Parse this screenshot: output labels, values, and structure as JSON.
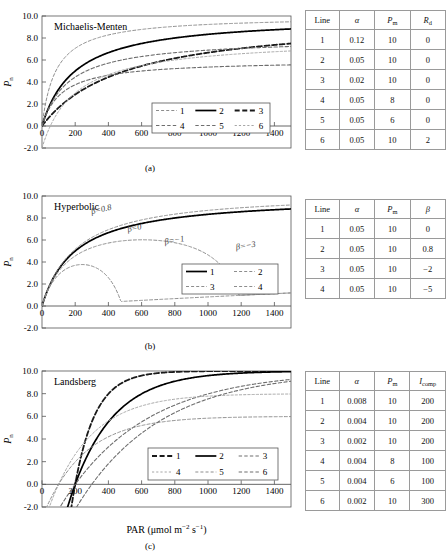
{
  "figure": {
    "xlabel_main": "PAR (μmol m",
    "xlabel_sup1": "−2",
    "xlabel_mid": " s",
    "xlabel_sup2": "−1",
    "xlabel_end": ")",
    "ylabel": "P",
    "ylabel_sub": "n"
  },
  "panels": [
    {
      "key": "a",
      "caption": "(a)",
      "title": "Michaelis-Menten",
      "legend_cols": 3,
      "legend_items": [
        "1",
        "2",
        "3",
        "4",
        "5",
        "6"
      ],
      "annotations": []
    },
    {
      "key": "b",
      "caption": "(b)",
      "title": "Hyperbolic",
      "legend_cols": 2,
      "legend_items": [
        "1",
        "2",
        "3",
        "4"
      ],
      "annotations": [
        {
          "text": "β=0.8",
          "x": 360,
          "y": 8.55,
          "rot": -13
        },
        {
          "text": "β=0",
          "x": 560,
          "y": 6.85,
          "rot": -12
        },
        {
          "text": "β=−1",
          "x": 800,
          "y": 5.75,
          "rot": -10
        },
        {
          "text": "β=−3",
          "x": 1230,
          "y": 5.25,
          "rot": -9
        }
      ]
    },
    {
      "key": "c",
      "caption": "(c)",
      "title": "Landsberg",
      "legend_cols": 3,
      "legend_items": [
        "1",
        "2",
        "3",
        "4",
        "5",
        "6"
      ],
      "annotations": []
    }
  ],
  "tables": [
    {
      "panel": "a",
      "headers": [
        "Line",
        "α",
        "P",
        "R"
      ],
      "header_subs": [
        "",
        "",
        "m",
        "d"
      ],
      "header_italic": [
        false,
        true,
        true,
        true
      ],
      "rows": [
        [
          "1",
          "0.12",
          "10",
          "0"
        ],
        [
          "2",
          "0.05",
          "10",
          "0"
        ],
        [
          "3",
          "0.02",
          "10",
          "0"
        ],
        [
          "4",
          "0.05",
          "8",
          "0"
        ],
        [
          "5",
          "0.05",
          "6",
          "0"
        ],
        [
          "6",
          "0.05",
          "10",
          "2"
        ]
      ]
    },
    {
      "panel": "b",
      "headers": [
        "Line",
        "α",
        "P",
        "β"
      ],
      "header_subs": [
        "",
        "",
        "m",
        ""
      ],
      "header_italic": [
        false,
        true,
        true,
        true
      ],
      "rows": [
        [
          "1",
          "0.05",
          "10",
          "0"
        ],
        [
          "2",
          "0.05",
          "10",
          "0.8"
        ],
        [
          "3",
          "0.05",
          "10",
          "−2"
        ],
        [
          "4",
          "0.05",
          "10",
          "−5"
        ]
      ]
    },
    {
      "panel": "c",
      "headers": [
        "Line",
        "α",
        "P",
        "I"
      ],
      "header_subs": [
        "",
        "",
        "m",
        "comp"
      ],
      "header_italic": [
        false,
        true,
        true,
        true
      ],
      "rows": [
        [
          "1",
          "0.008",
          "10",
          "200"
        ],
        [
          "2",
          "0.004",
          "10",
          "200"
        ],
        [
          "3",
          "0.002",
          "10",
          "200"
        ],
        [
          "4",
          "0.004",
          "8",
          "100"
        ],
        [
          "5",
          "0.004",
          "6",
          "100"
        ],
        [
          "6",
          "0.002",
          "10",
          "300"
        ]
      ]
    }
  ],
  "chart_data": [
    {
      "type": "line",
      "panel": "a",
      "title": "Michaelis-Menten",
      "xlabel": "PAR (μmol m−2 s−1)",
      "ylabel": "Pn",
      "xlim": [
        0,
        1500
      ],
      "ylim": [
        -2.0,
        10.0
      ],
      "xticks": [
        0,
        200,
        400,
        600,
        800,
        1000,
        1200,
        1400
      ],
      "yticks": [
        -2.0,
        0.0,
        2.0,
        4.0,
        6.0,
        8.0,
        10.0
      ],
      "ytick_labels": [
        "-2.0",
        "0.0",
        "2.0",
        "4.0",
        "6.0",
        "8.0",
        "10.0"
      ],
      "grid": false,
      "legend_position": "lower-right",
      "model": "michaelis-menten",
      "equation": "Pn = alpha*I*Pm/(alpha*I + Pm) - Rd",
      "series": [
        {
          "name": "1",
          "alpha": 0.12,
          "Pm": 10,
          "Rd": 0,
          "style": "dash-fine",
          "color": "#8d8d8d",
          "width": 1.0
        },
        {
          "name": "2",
          "alpha": 0.05,
          "Pm": 10,
          "Rd": 0,
          "style": "solid",
          "color": "#000000",
          "width": 1.7
        },
        {
          "name": "3",
          "alpha": 0.02,
          "Pm": 10,
          "Rd": 0,
          "style": "dash-bold",
          "color": "#1a1a1a",
          "width": 1.8
        },
        {
          "name": "4",
          "alpha": 0.05,
          "Pm": 8,
          "Rd": 0,
          "style": "dash-med",
          "color": "#6e6e6e",
          "width": 1.1
        },
        {
          "name": "5",
          "alpha": 0.05,
          "Pm": 6,
          "Rd": 0,
          "style": "dash-med",
          "color": "#6e6e6e",
          "width": 1.1
        },
        {
          "name": "6",
          "alpha": 0.05,
          "Pm": 10,
          "Rd": 2,
          "style": "dot-fine",
          "color": "#a6a6a6",
          "width": 1.0
        }
      ]
    },
    {
      "type": "line",
      "panel": "b",
      "title": "Hyperbolic",
      "xlabel": "PAR (μmol m−2 s−1)",
      "ylabel": "Pn",
      "xlim": [
        0,
        1500
      ],
      "ylim": [
        -2.0,
        10.0
      ],
      "xticks": [
        0,
        200,
        400,
        600,
        800,
        1000,
        1200,
        1400
      ],
      "yticks": [
        -2.0,
        0.0,
        2.0,
        4.0,
        6.0,
        8.0,
        10.0
      ],
      "ytick_labels": [
        "-2.0",
        "0.0",
        "2.0",
        "4.0",
        "6.0",
        "8.0",
        "10.0"
      ],
      "grid": false,
      "legend_position": "lower-right",
      "model": "hyperbolic-beta",
      "equation": "Pn = alpha*I*(1+beta*I/1500)*Pm/(alpha*I*(1+beta*I/1500)+Pm)",
      "series": [
        {
          "name": "1",
          "alpha": 0.05,
          "Pm": 10,
          "beta": 0,
          "style": "solid",
          "color": "#000000",
          "width": 1.7
        },
        {
          "name": "2",
          "alpha": 0.05,
          "Pm": 10,
          "beta": 0.8,
          "style": "dash-fine",
          "color": "#8d8d8d",
          "width": 1.0
        },
        {
          "name": "3",
          "alpha": 0.05,
          "Pm": 10,
          "beta": -2,
          "style": "dash-fine",
          "color": "#8d8d8d",
          "width": 1.0
        },
        {
          "name": "4",
          "alpha": 0.05,
          "Pm": 10,
          "beta": -5,
          "style": "dash-fine",
          "color": "#8d8d8d",
          "width": 1.0
        }
      ]
    },
    {
      "type": "line",
      "panel": "c",
      "title": "Landsberg",
      "xlabel": "PAR (μmol m−2 s−1)",
      "ylabel": "Pn",
      "xlim": [
        0,
        1500
      ],
      "ylim": [
        -2.0,
        10.0
      ],
      "xticks": [
        0,
        200,
        400,
        600,
        800,
        1000,
        1200,
        1400
      ],
      "yticks": [
        -2.0,
        0.0,
        2.0,
        4.0,
        6.0,
        8.0,
        10.0
      ],
      "ytick_labels": [
        "-2.0",
        "0.0",
        "2.0",
        "4.0",
        "6.0",
        "8.0",
        "10.0"
      ],
      "grid": false,
      "legend_position": "center-right",
      "model": "landsberg",
      "equation": "Pn = Pm*(1 - exp(-alpha*(I - Icomp)))",
      "series": [
        {
          "name": "1",
          "alpha": 0.008,
          "Pm": 10,
          "Icomp": 200,
          "style": "dash-bold",
          "color": "#1a1a1a",
          "width": 1.8
        },
        {
          "name": "2",
          "alpha": 0.004,
          "Pm": 10,
          "Icomp": 200,
          "style": "solid",
          "color": "#000000",
          "width": 1.7
        },
        {
          "name": "3",
          "alpha": 0.002,
          "Pm": 10,
          "Icomp": 200,
          "style": "dash-med",
          "color": "#6e6e6e",
          "width": 1.1
        },
        {
          "name": "4",
          "alpha": 0.004,
          "Pm": 8,
          "Icomp": 100,
          "style": "dot-fine",
          "color": "#a6a6a6",
          "width": 1.0
        },
        {
          "name": "5",
          "alpha": 0.004,
          "Pm": 6,
          "Icomp": 100,
          "style": "dash-fine",
          "color": "#8d8d8d",
          "width": 1.0
        },
        {
          "name": "6",
          "alpha": 0.002,
          "Pm": 10,
          "Icomp": 300,
          "style": "dash-med",
          "color": "#6e6e6e",
          "width": 1.1
        }
      ]
    }
  ]
}
